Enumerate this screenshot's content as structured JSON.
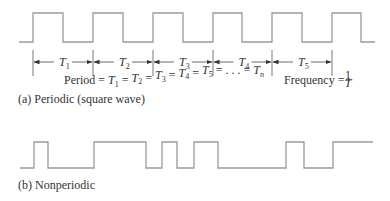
{
  "periodic": {
    "caption": "(a) Periodic (square wave)",
    "wave_points": "19,42 33,42 33,13 63,13 63,42 93,42 93,13 123,13 123,42 153,42 153,13 183,13 183,42 213,42 213,13 242,13 242,42 272,42 272,13 302,13 302,42 332,42 332,13 361,13 361,42 375,42",
    "period_ticks_x": [
      33,
      93,
      153,
      213,
      272,
      332
    ],
    "period_labels": [
      {
        "base": "T",
        "sub": "1"
      },
      {
        "base": "T",
        "sub": "2"
      },
      {
        "base": "T",
        "sub": "3"
      },
      {
        "base": "T",
        "sub": "4"
      },
      {
        "base": "T",
        "sub": "5"
      }
    ],
    "equation": {
      "prefix": "Period = ",
      "terms": [
        "1",
        "2",
        "3",
        "4",
        "5"
      ],
      "ellipsis": ". . .",
      "last_sub": "n"
    },
    "frequency": {
      "label": "Frequency = ",
      "numerator": "1",
      "denominator": "T"
    }
  },
  "nonperiodic": {
    "caption": "(b) Nonperiodic",
    "wave_points": "20,168 34,168 34,142 48,142 48,168 94,168 94,142 146,142 146,168 162,168 162,142 177,142 177,168 194,168 194,142 218,142 218,168 286,168 286,142 304,142 304,168 333,168 333,142 373,142"
  }
}
